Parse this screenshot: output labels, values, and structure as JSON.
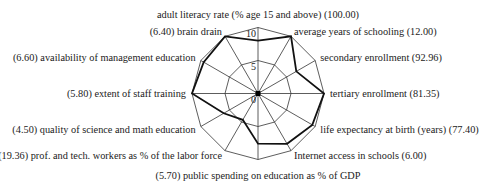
{
  "chart_data": {
    "type": "radar",
    "title": "",
    "scale": {
      "min": 0,
      "max": 10,
      "ticks": [
        0,
        5,
        10
      ]
    },
    "grid": true,
    "axes": [
      {
        "label": "adult literacy rate (% age 15 and above) (100.00)",
        "raw_value": "100.00",
        "normalized": 8.0,
        "anchor": "middle"
      },
      {
        "label": "average years of schooling (12.00)",
        "raw_value": "12.00",
        "normalized": 10.0,
        "anchor": "start"
      },
      {
        "label": "secondary enrollment (92.96)",
        "raw_value": "92.96",
        "normalized": 6.7,
        "anchor": "start"
      },
      {
        "label": "tertiary enrollment (81.35)",
        "raw_value": "81.35",
        "normalized": 10.0,
        "anchor": "start"
      },
      {
        "label": "life expectancy at birth (years) (77.40)",
        "raw_value": "77.40",
        "normalized": 9.5,
        "anchor": "start"
      },
      {
        "label": "Internet access in schools (6.00)",
        "raw_value": "6.00",
        "normalized": 8.8,
        "anchor": "start"
      },
      {
        "label": "(5.70) public spending on education as % of GDP",
        "raw_value": "5.70",
        "normalized": 7.6,
        "anchor": "middle"
      },
      {
        "label": "(19.36) prof. and tech. workers as % of the labor force",
        "raw_value": "19.36",
        "normalized": 4.6,
        "anchor": "end"
      },
      {
        "label": "(4.50) quality of science and math education",
        "raw_value": "4.50",
        "normalized": 6.0,
        "anchor": "end"
      },
      {
        "label": "(5.80) extent of staff training",
        "raw_value": "5.80",
        "normalized": 10.0,
        "anchor": "end"
      },
      {
        "label": "(6.60) availability of management education",
        "raw_value": "6.60",
        "normalized": 9.5,
        "anchor": "end"
      },
      {
        "label": "(6.40) brain drain",
        "raw_value": "6.40",
        "normalized": 10.0,
        "anchor": "end"
      }
    ],
    "series": [
      {
        "name": "country",
        "values": [
          8.0,
          10.0,
          6.7,
          10.0,
          9.5,
          8.8,
          7.6,
          4.6,
          6.0,
          10.0,
          9.5,
          10.0
        ]
      }
    ],
    "legend": null
  },
  "layout": {
    "center_x": 258,
    "center_y": 93.5,
    "radius": 66,
    "colors": {
      "grid": "#333333",
      "series": "#111111",
      "text": "#222222"
    }
  }
}
